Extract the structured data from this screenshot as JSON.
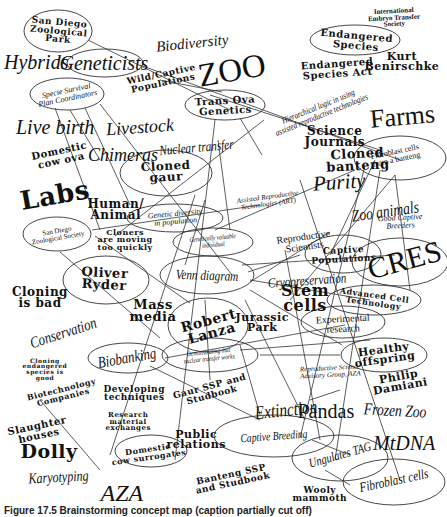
{
  "diagram": {
    "line_color": "#333333",
    "ellipses": [
      {
        "id": "san-diego-zoological-park",
        "cx": 58,
        "cy": 31,
        "rx": 34,
        "ry": 21
      },
      {
        "id": "geneticists",
        "cx": 105,
        "cy": 63,
        "rx": 38,
        "ry": 14
      },
      {
        "id": "specie-survival",
        "cx": 67,
        "cy": 94,
        "rx": 37,
        "ry": 16
      },
      {
        "id": "endangered-species",
        "cx": 355,
        "cy": 40,
        "rx": 45,
        "ry": 15
      },
      {
        "id": "trans-ova-genetics",
        "cx": 225,
        "cy": 105,
        "rx": 40,
        "ry": 15
      },
      {
        "id": "cloned-gaur",
        "cx": 166,
        "cy": 173,
        "rx": 46,
        "ry": 23
      },
      {
        "id": "cloned-banteng",
        "cx": 400,
        "cy": 158,
        "rx": 46,
        "ry": 22,
        "note": "partially offscreen adjusted"
      },
      {
        "id": "genetic-diversity",
        "cx": 175,
        "cy": 218,
        "rx": 48,
        "ry": 14
      },
      {
        "id": "genetically-valuable",
        "cx": 213,
        "cy": 242,
        "rx": 40,
        "ry": 14
      },
      {
        "id": "san-diego-zoological-society",
        "cx": 57,
        "cy": 234,
        "rx": 34,
        "ry": 17
      },
      {
        "id": "oliver-ryder",
        "cx": 106,
        "cy": 280,
        "rx": 43,
        "ry": 24
      },
      {
        "id": "venn-diagram",
        "cx": 207,
        "cy": 275,
        "rx": 47,
        "ry": 19
      },
      {
        "id": "robert-lanza",
        "cx": 208,
        "cy": 325,
        "rx": 40,
        "ry": 27
      },
      {
        "id": "demonstrating",
        "cx": 210,
        "cy": 355,
        "rx": 48,
        "ry": 17
      },
      {
        "id": "biobanking",
        "cx": 128,
        "cy": 358,
        "rx": 40,
        "ry": 15
      },
      {
        "id": "captive-populations",
        "cx": 343,
        "cy": 254,
        "rx": 38,
        "ry": 19
      },
      {
        "id": "cres",
        "cx": 400,
        "cy": 262,
        "rx": 48,
        "ry": 24
      },
      {
        "id": "advanced-cell-technology",
        "cx": 374,
        "cy": 300,
        "rx": 47,
        "ry": 15
      },
      {
        "id": "experimental-research",
        "cx": 343,
        "cy": 322,
        "rx": 42,
        "ry": 16
      },
      {
        "id": "healthy-offspring",
        "cx": 384,
        "cy": 355,
        "rx": 43,
        "ry": 17
      },
      {
        "id": "domestic-cow-surrogates",
        "cx": 151,
        "cy": 451,
        "rx": 36,
        "ry": 16
      },
      {
        "id": "captive-breeding",
        "cx": 274,
        "cy": 436,
        "rx": 60,
        "ry": 21
      },
      {
        "id": "ungulates-tag",
        "cx": 340,
        "cy": 458,
        "rx": 48,
        "ry": 23
      },
      {
        "id": "fibroblast-cells",
        "cx": 394,
        "cy": 482,
        "rx": 51,
        "ry": 23
      }
    ],
    "lines": [
      [
        88,
        40,
        230,
        110
      ],
      [
        140,
        65,
        400,
        160
      ],
      [
        100,
        104,
        232,
        275
      ],
      [
        55,
        108,
        100,
        230
      ],
      [
        85,
        108,
        130,
        205
      ],
      [
        70,
        110,
        100,
        160
      ],
      [
        40,
        400,
        100,
        470
      ],
      [
        240,
        118,
        262,
        155
      ],
      [
        264,
        120,
        115,
        236
      ],
      [
        205,
        200,
        185,
        265
      ],
      [
        195,
        195,
        110,
        455
      ],
      [
        215,
        120,
        175,
        460
      ],
      [
        375,
        160,
        330,
        255
      ],
      [
        365,
        165,
        300,
        438
      ],
      [
        355,
        170,
        215,
        230
      ],
      [
        380,
        170,
        335,
        460
      ],
      [
        395,
        175,
        410,
        290
      ],
      [
        395,
        175,
        290,
        300
      ],
      [
        92,
        230,
        260,
        205
      ],
      [
        95,
        236,
        190,
        303
      ],
      [
        60,
        252,
        160,
        338
      ],
      [
        248,
        272,
        300,
        255
      ],
      [
        250,
        282,
        330,
        232
      ],
      [
        250,
        280,
        370,
        300
      ],
      [
        242,
        265,
        395,
        255
      ],
      [
        250,
        290,
        342,
        345
      ],
      [
        165,
        358,
        345,
        325
      ],
      [
        240,
        350,
        370,
        340
      ],
      [
        260,
        355,
        340,
        355
      ],
      [
        205,
        300,
        210,
        380
      ],
      [
        240,
        345,
        260,
        415
      ],
      [
        245,
        300,
        305,
        420
      ],
      [
        150,
        366,
        260,
        420
      ],
      [
        310,
        400,
        340,
        390
      ],
      [
        312,
        440,
        350,
        455
      ],
      [
        325,
        470,
        350,
        485
      ],
      [
        285,
        250,
        320,
        440
      ],
      [
        300,
        180,
        400,
        480
      ],
      [
        218,
        140,
        230,
        230
      ],
      [
        210,
        95,
        380,
        150
      ],
      [
        160,
        80,
        222,
        92
      ]
    ],
    "labels": [
      {
        "id": "san-diego-zoological-park",
        "text": "San Diego\nZoological\nPark",
        "x": 58,
        "y": 31,
        "size": 9,
        "style": "wide",
        "rot": 5
      },
      {
        "id": "hybrids",
        "text": "Hybrids",
        "x": 36,
        "y": 62,
        "size": 20,
        "style": "serif-i",
        "rot": 0
      },
      {
        "id": "geneticists",
        "text": "Geneticists",
        "x": 104,
        "y": 63,
        "size": 20,
        "style": "serif-i",
        "rot": 0
      },
      {
        "id": "specie-survival",
        "text": "Specie Survival\nPlan Coordinators",
        "x": 67,
        "y": 94,
        "size": 8,
        "style": "serif-i",
        "rot": -12
      },
      {
        "id": "biodiversity",
        "text": "Biodiversity",
        "x": 192,
        "y": 43,
        "size": 15,
        "style": "serif-i",
        "rot": -6
      },
      {
        "id": "wild-captive",
        "text": "Wild/Captive\nPopulations",
        "x": 162,
        "y": 78,
        "size": 9,
        "style": "wide",
        "rot": -12
      },
      {
        "id": "zoo",
        "text": "ZOO",
        "x": 232,
        "y": 70,
        "size": 33,
        "style": "serif-n",
        "rot": -10
      },
      {
        "id": "endangered-species",
        "text": "Endangered\nSpecies",
        "x": 356,
        "y": 40,
        "size": 10,
        "style": "wide",
        "rot": 5
      },
      {
        "id": "endangered-species-act",
        "text": "Endangered\nSpecies Act",
        "x": 337,
        "y": 68,
        "size": 10,
        "style": "wide",
        "rot": -4
      },
      {
        "id": "international-embryo",
        "text": "International\nEmbryo Transfer\nSociety",
        "x": 394,
        "y": 18,
        "size": 7,
        "style": "serif-b",
        "rot": -3
      },
      {
        "id": "kurt-benirschke",
        "text": "Kurt\nBenirschke",
        "x": 402,
        "y": 62,
        "size": 11,
        "style": "wide",
        "rot": 0
      },
      {
        "id": "trans-ova-genetics",
        "text": "Trans Ova\nGenetics",
        "x": 225,
        "y": 105,
        "size": 10,
        "style": "wide",
        "rot": -3
      },
      {
        "id": "hierarchical-logic",
        "text": "Hierarchical logic in using\nassisted reproductive technologies",
        "x": 320,
        "y": 110,
        "size": 9,
        "style": "cond",
        "rot": -22
      },
      {
        "id": "farms",
        "text": "Farms",
        "x": 402,
        "y": 117,
        "size": 26,
        "style": "serif-n",
        "rot": -5
      },
      {
        "id": "live-birth",
        "text": "Live birth",
        "x": 55,
        "y": 127,
        "size": 20,
        "style": "serif-i",
        "rot": 0
      },
      {
        "id": "livestock",
        "text": "Livestock",
        "x": 140,
        "y": 127,
        "size": 18,
        "style": "serif-i",
        "rot": -4
      },
      {
        "id": "science-journals",
        "text": "Science\nJournals",
        "x": 335,
        "y": 137,
        "size": 12,
        "style": "wide",
        "rot": 0
      },
      {
        "id": "domestic-cow-ova",
        "text": "Domestic\ncow ova",
        "x": 60,
        "y": 155,
        "size": 10,
        "style": "wide",
        "rot": -12
      },
      {
        "id": "chimeras",
        "text": "Chimeras",
        "x": 123,
        "y": 155,
        "size": 18,
        "style": "serif-i",
        "rot": 0
      },
      {
        "id": "nuclear-transfer",
        "text": "Nuclear transfer",
        "x": 196,
        "y": 147,
        "size": 14,
        "style": "cond",
        "rot": -5
      },
      {
        "id": "cloned-gaur",
        "text": "Cloned\ngaur",
        "x": 166,
        "y": 172,
        "size": 12,
        "style": "wide",
        "rot": -3
      },
      {
        "id": "cloned-banteng",
        "text": "Cloned\nbanteng",
        "x": 357,
        "y": 160,
        "size": 13,
        "style": "wide",
        "rot": -3
      },
      {
        "id": "fibroblast-banteng",
        "text": "Fibroblast cells\nfrom a banteng",
        "x": 395,
        "y": 155,
        "size": 8,
        "style": "serif-n",
        "rot": -12
      },
      {
        "id": "labs",
        "text": "Labs",
        "x": 55,
        "y": 195,
        "size": 26,
        "style": "wide",
        "rot": -10
      },
      {
        "id": "purity",
        "text": "Purity",
        "x": 339,
        "y": 183,
        "size": 21,
        "style": "serif-i",
        "rot": -4
      },
      {
        "id": "human-animal",
        "text": "Human/\nAnimal",
        "x": 116,
        "y": 210,
        "size": 12,
        "style": "wide",
        "rot": 0
      },
      {
        "id": "art",
        "text": "Assisted Reproductive\nTechnologies (ART)",
        "x": 268,
        "y": 200,
        "size": 7,
        "style": "serif-i",
        "rot": -8
      },
      {
        "id": "genetic-diversity",
        "text": "Genetic diversity\nin population",
        "x": 175,
        "y": 217,
        "size": 8,
        "style": "serif-i",
        "rot": -5
      },
      {
        "id": "genetically-valuable",
        "text": "Genetically valuable\nindividual",
        "x": 213,
        "y": 241,
        "size": 7,
        "style": "cond",
        "rot": -5
      },
      {
        "id": "reproductive-scientists",
        "text": "Reproductive\nScientists",
        "x": 304,
        "y": 241,
        "size": 10,
        "style": "serif-n",
        "rot": -8
      },
      {
        "id": "zoo-animals",
        "text": "Zoo animals",
        "x": 385,
        "y": 212,
        "size": 17,
        "style": "cond",
        "rot": -8
      },
      {
        "id": "good-captive-breeders",
        "text": "Good Captive\nBreeders",
        "x": 400,
        "y": 221,
        "size": 8,
        "style": "serif-i",
        "rot": -3
      },
      {
        "id": "san-diego-zoological-society",
        "text": "San Diego\nZoological Society",
        "x": 57,
        "y": 234,
        "size": 7,
        "style": "serif-n",
        "rot": -10
      },
      {
        "id": "cloners-moving",
        "text": "Cloners\nare moving\ntoo quickly",
        "x": 125,
        "y": 240,
        "size": 8,
        "style": "wide",
        "rot": 0
      },
      {
        "id": "captive-populations",
        "text": "Captive\nPopulations",
        "x": 343,
        "y": 254,
        "size": 9,
        "style": "wide",
        "rot": -3
      },
      {
        "id": "cres",
        "text": "CRES",
        "x": 404,
        "y": 260,
        "size": 30,
        "style": "serif-n",
        "rot": -15
      },
      {
        "id": "oliver-ryder",
        "text": "Oliver\nRyder",
        "x": 104,
        "y": 279,
        "size": 13,
        "style": "wide",
        "rot": 3
      },
      {
        "id": "venn-diagram",
        "text": "Venn diagram",
        "x": 207,
        "y": 275,
        "size": 14,
        "style": "cond",
        "rot": 2
      },
      {
        "id": "cryopreservation",
        "text": "Cryopreservation",
        "x": 307,
        "y": 280,
        "size": 14,
        "style": "cond",
        "rot": -4
      },
      {
        "id": "stem-cells",
        "text": "Stem\ncells",
        "x": 305,
        "y": 298,
        "size": 16,
        "style": "wide",
        "rot": 0
      },
      {
        "id": "advanced-cell-technology",
        "text": "Advanced Cell\nTechnology",
        "x": 374,
        "y": 299,
        "size": 8,
        "style": "wide",
        "rot": 8
      },
      {
        "id": "cloning-is-bad",
        "text": "Cloning\nis bad",
        "x": 40,
        "y": 298,
        "size": 12,
        "style": "wide",
        "rot": 0
      },
      {
        "id": "mass-media",
        "text": "Mass\nmedia",
        "x": 153,
        "y": 311,
        "size": 13,
        "style": "wide",
        "rot": 0
      },
      {
        "id": "robert-lanza",
        "text": "Robert\nLanza",
        "x": 210,
        "y": 327,
        "size": 14,
        "style": "wide",
        "rot": -15
      },
      {
        "id": "jurassic-park",
        "text": "Jurassic\nPark",
        "x": 262,
        "y": 323,
        "size": 11,
        "style": "wide",
        "rot": 0
      },
      {
        "id": "experimental-research",
        "text": "Experimental\nresearch",
        "x": 343,
        "y": 323,
        "size": 10,
        "style": "serif-n",
        "rot": -3
      },
      {
        "id": "conservation",
        "text": "Conservation",
        "x": 63,
        "y": 332,
        "size": 16,
        "style": "cond",
        "rot": -18
      },
      {
        "id": "demonstrating",
        "text": "Demonstrating that\nnuclear transfer works",
        "x": 209,
        "y": 355,
        "size": 7,
        "style": "cond",
        "rot": -6
      },
      {
        "id": "biobanking",
        "text": "Biobanking",
        "x": 127,
        "y": 357,
        "size": 16,
        "style": "cond",
        "rot": -10
      },
      {
        "id": "cloning-endangered",
        "text": "Cloning\nendangered\nspecies is\ngood",
        "x": 45,
        "y": 369,
        "size": 6,
        "style": "wide",
        "rot": 0
      },
      {
        "id": "healthy-offspring",
        "text": "Healthy\noffspring",
        "x": 384,
        "y": 355,
        "size": 11,
        "style": "wide",
        "rot": -8
      },
      {
        "id": "reproductive-science-advisory",
        "text": "Reproductive Science\nAdvisory Group, AZA",
        "x": 330,
        "y": 371,
        "size": 7,
        "style": "serif-i",
        "rot": -3
      },
      {
        "id": "philip-damiani",
        "text": "Philip\nDamiani",
        "x": 399,
        "y": 382,
        "size": 11,
        "style": "wide",
        "rot": -10
      },
      {
        "id": "biotechnology-companies",
        "text": "Biotechnology\nCompanies",
        "x": 62,
        "y": 393,
        "size": 8,
        "style": "wide",
        "rot": -14
      },
      {
        "id": "developing-techniques",
        "text": "Developing\ntechniques",
        "x": 134,
        "y": 393,
        "size": 9,
        "style": "wide",
        "rot": 0
      },
      {
        "id": "gaur-ssp",
        "text": "Gaur SSP and\nStudbook",
        "x": 210,
        "y": 390,
        "size": 9,
        "style": "wide",
        "rot": -15
      },
      {
        "id": "slaughter-houses",
        "text": "Slaughter\nhouses",
        "x": 38,
        "y": 430,
        "size": 10,
        "style": "wide",
        "rot": -12
      },
      {
        "id": "research-material",
        "text": "Research\nmaterial\nexchanges",
        "x": 128,
        "y": 422,
        "size": 7,
        "style": "wide",
        "rot": 0
      },
      {
        "id": "extinction",
        "text": "Extinction",
        "x": 286,
        "y": 410,
        "size": 19,
        "style": "cond",
        "rot": -6
      },
      {
        "id": "pandas",
        "text": "Pandas",
        "x": 326,
        "y": 411,
        "size": 20,
        "style": "serif-n",
        "rot": 0
      },
      {
        "id": "frozen-zoo",
        "text": "Frozen Zoo",
        "x": 395,
        "y": 411,
        "size": 17,
        "style": "cond",
        "rot": 3
      },
      {
        "id": "dolly",
        "text": "Dolly",
        "x": 49,
        "y": 451,
        "size": 19,
        "style": "wide",
        "rot": 0
      },
      {
        "id": "public-relations",
        "text": "Public\nrelations",
        "x": 196,
        "y": 440,
        "size": 11,
        "style": "wide",
        "rot": 0
      },
      {
        "id": "captive-breeding",
        "text": "Captive Breeding",
        "x": 274,
        "y": 436,
        "size": 12,
        "style": "cond",
        "rot": -4
      },
      {
        "id": "mtdna",
        "text": "MtDNA",
        "x": 404,
        "y": 443,
        "size": 20,
        "style": "serif-i",
        "rot": 0
      },
      {
        "id": "domestic-cow-surrogates",
        "text": "Domestic\ncow surrogates",
        "x": 148,
        "y": 453,
        "size": 8,
        "style": "wide",
        "rot": -8
      },
      {
        "id": "ungulates-tag",
        "text": "Ungulates TAG",
        "x": 340,
        "y": 455,
        "size": 13,
        "style": "cond",
        "rot": -16
      },
      {
        "id": "karyotyping",
        "text": "Karyotyping",
        "x": 58,
        "y": 477,
        "size": 15,
        "style": "cond",
        "rot": -3
      },
      {
        "id": "banteng-ssp",
        "text": "Banteng SSP\nand Studbook",
        "x": 232,
        "y": 478,
        "size": 9,
        "style": "wide",
        "rot": -12
      },
      {
        "id": "fibroblast-cells",
        "text": "Fibroblast cells",
        "x": 394,
        "y": 480,
        "size": 14,
        "style": "cond",
        "rot": -12
      },
      {
        "id": "aza",
        "text": "AZA",
        "x": 122,
        "y": 493,
        "size": 24,
        "style": "serif-i",
        "rot": 0
      },
      {
        "id": "wooly-mammoth",
        "text": "Wooly\nmammoth",
        "x": 320,
        "y": 494,
        "size": 9,
        "style": "wide",
        "rot": 0
      }
    ]
  },
  "caption": {
    "text": "Figure 17.5  Brainstorming concept map (caption partially cut off)"
  }
}
